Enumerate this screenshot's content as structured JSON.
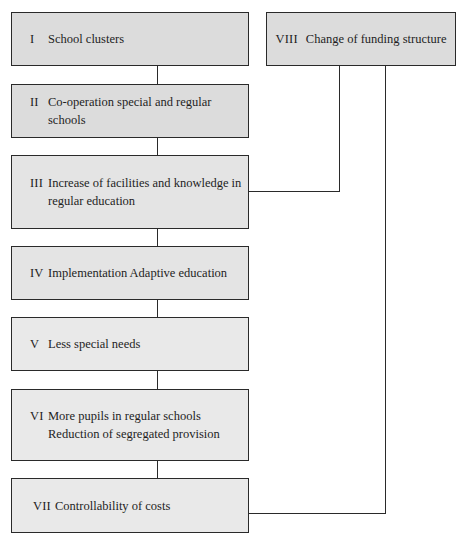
{
  "diagram": {
    "type": "flowchart",
    "steps": [
      {
        "id": "I",
        "numeral": "I",
        "lines": [
          "School clusters"
        ]
      },
      {
        "id": "II",
        "numeral": "II",
        "lines": [
          "Co-operation special and regular schools"
        ]
      },
      {
        "id": "III",
        "numeral": "III",
        "lines": [
          "Increase of facilities and knowledge in",
          "regular education"
        ]
      },
      {
        "id": "IV",
        "numeral": "IV",
        "lines": [
          "Implementation Adaptive education"
        ]
      },
      {
        "id": "V",
        "numeral": "V",
        "lines": [
          "Less special needs"
        ]
      },
      {
        "id": "VI",
        "numeral": "VI",
        "lines": [
          "More pupils in regular schools",
          "Reduction of segregated provision"
        ]
      },
      {
        "id": "VII",
        "numeral": "VII",
        "lines": [
          "Controllability of costs"
        ]
      }
    ],
    "side_box": {
      "id": "VIII",
      "numeral": "VIII",
      "label": "Change of funding structure"
    },
    "connections": [
      {
        "from": "I",
        "to": "II"
      },
      {
        "from": "II",
        "to": "III"
      },
      {
        "from": "III",
        "to": "IV"
      },
      {
        "from": "IV",
        "to": "V"
      },
      {
        "from": "V",
        "to": "VI"
      },
      {
        "from": "VI",
        "to": "VII"
      },
      {
        "from": "VIII",
        "to": "III"
      },
      {
        "from": "VIII",
        "to": "VII"
      }
    ],
    "colors": {
      "box_fill": "#e4e4e4",
      "border": "#2a2a2a",
      "background": "#ffffff"
    }
  }
}
